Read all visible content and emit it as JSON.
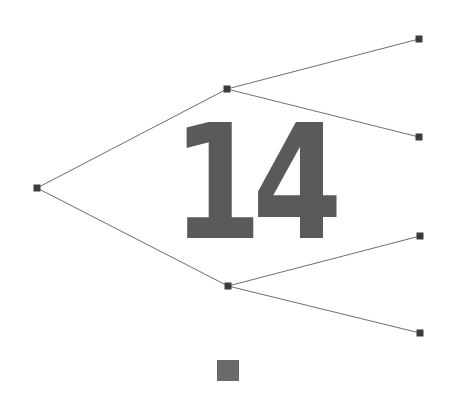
{
  "diagram": {
    "type": "tree",
    "label": "14",
    "colors": {
      "edge": "#6e6e6e",
      "node": "#3c3c3c",
      "label": "#5a5a5a",
      "marker": "#6a6a6a"
    },
    "nodes": [
      {
        "id": "root",
        "x": 37,
        "y": 188
      },
      {
        "id": "mid-upper",
        "x": 227,
        "y": 89
      },
      {
        "id": "mid-lower",
        "x": 228,
        "y": 286
      },
      {
        "id": "leaf-1",
        "x": 419,
        "y": 39
      },
      {
        "id": "leaf-2",
        "x": 419,
        "y": 137
      },
      {
        "id": "leaf-3",
        "x": 420,
        "y": 236
      },
      {
        "id": "leaf-4",
        "x": 420,
        "y": 333
      }
    ],
    "edges": [
      [
        "root",
        "mid-upper"
      ],
      [
        "root",
        "mid-lower"
      ],
      [
        "mid-upper",
        "leaf-1"
      ],
      [
        "mid-upper",
        "leaf-2"
      ],
      [
        "mid-lower",
        "leaf-3"
      ],
      [
        "mid-lower",
        "leaf-4"
      ]
    ]
  }
}
